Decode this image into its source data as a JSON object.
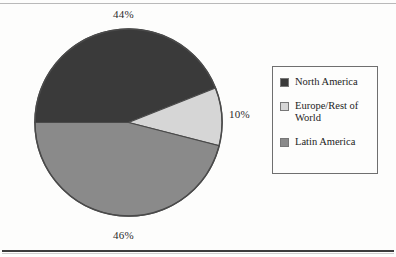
{
  "chart_data": {
    "type": "pie",
    "title": "",
    "categories": [
      "North America",
      "Europe/Rest of World",
      "Latin America"
    ],
    "values": [
      44,
      46,
      10
    ],
    "slices": [
      {
        "label": "North America",
        "value": 44,
        "display": "44%",
        "color": "#3a3a3a",
        "start_angle_deg": 180,
        "sweep_deg": 158.4
      },
      {
        "label": "Europe/Rest of World",
        "value": 10,
        "display": "10%",
        "color": "#d6d6d6",
        "start_angle_deg": 338.4,
        "sweep_deg": 36.0
      },
      {
        "label": "Latin America",
        "value": 46,
        "display": "46%",
        "color": "#8a8a8a",
        "start_angle_deg": 14.4,
        "sweep_deg": 165.6
      }
    ],
    "value_suffix": "%",
    "legend_position": "right",
    "grid": false,
    "outline_color": "#4a4a4a",
    "start_angle_deg": 180,
    "direction": "clockwise"
  },
  "callouts": {
    "top": "44%",
    "right": "10%",
    "bottom": "46%"
  },
  "legend": {
    "items": [
      {
        "label": "North America",
        "color": "#3a3a3a"
      },
      {
        "label": "Europe/Rest of World",
        "color": "#d6d6d6"
      },
      {
        "label": "Latin America",
        "color": "#8a8a8a"
      }
    ]
  }
}
